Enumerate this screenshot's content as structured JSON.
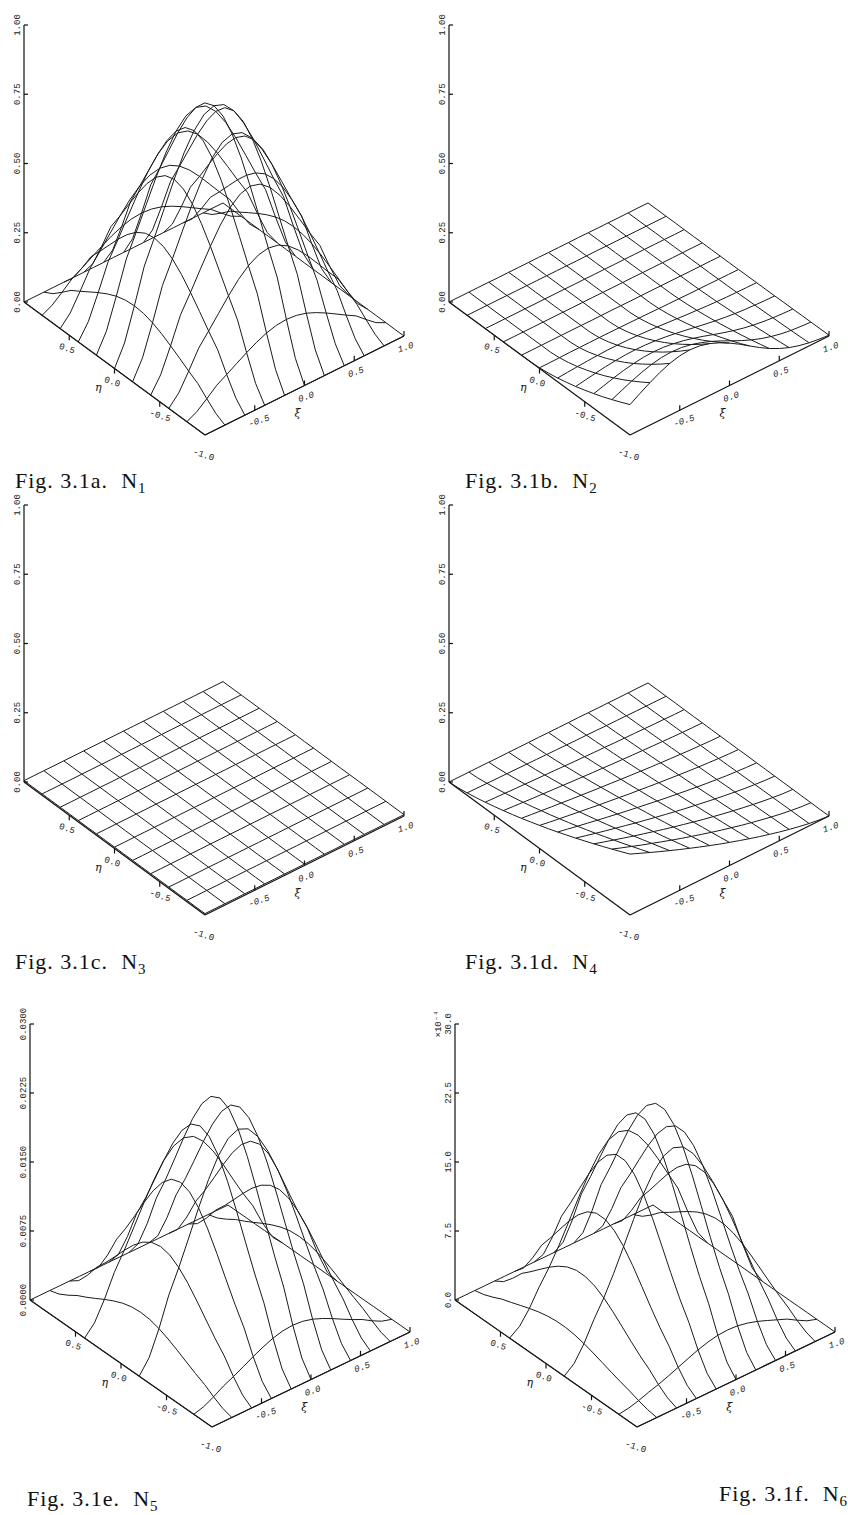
{
  "page": {
    "figures": [
      {
        "id": "a",
        "caption_prefix": "Fig. 3.1a.",
        "caption_symbol": "N",
        "caption_sub": "1"
      },
      {
        "id": "b",
        "caption_prefix": "Fig. 3.1b.",
        "caption_symbol": "N",
        "caption_sub": "2"
      },
      {
        "id": "c",
        "caption_prefix": "Fig. 3.1c.",
        "caption_symbol": "N",
        "caption_sub": "3"
      },
      {
        "id": "d",
        "caption_prefix": "Fig. 3.1d.",
        "caption_symbol": "N",
        "caption_sub": "4"
      },
      {
        "id": "e",
        "caption_prefix": "Fig. 3.1e.",
        "caption_symbol": "N",
        "caption_sub": "5"
      },
      {
        "id": "f",
        "caption_prefix": "Fig. 3.1f.",
        "caption_symbol": "N",
        "caption_sub": "6"
      }
    ]
  },
  "chart_data": [
    {
      "type": "surface3d",
      "title": "Fig. 3.1a. N1",
      "xlabel": "ξ",
      "ylabel": "η",
      "zlabel": "",
      "x_ticks": [
        "-0.5",
        "0.0",
        "0.5",
        "1.0"
      ],
      "y_ticks": [
        "0.5",
        "0.0",
        "-0.5",
        "-1.0"
      ],
      "z_ticks": [
        "0.00",
        "0.25",
        "0.50",
        "0.75",
        "1.00"
      ],
      "zlim": [
        0,
        1.0
      ],
      "z_multiplier": "",
      "grid_lines": "both",
      "surface": {
        "shape": "dome",
        "peak": 0.77,
        "peak_xi": 0.0,
        "peak_eta": 0.0,
        "width": 0.55,
        "edge_xi_minus": 0.12,
        "edge_eta_plus": 0.12
      }
    },
    {
      "type": "surface3d",
      "title": "Fig. 3.1b. N2",
      "xlabel": "ξ",
      "ylabel": "η",
      "zlabel": "",
      "x_ticks": [
        "-0.5",
        "0.0",
        "0.5",
        "1.0"
      ],
      "y_ticks": [
        "0.5",
        "0.0",
        "-0.5",
        "-1.0"
      ],
      "z_ticks": [
        "0.00",
        "0.25",
        "0.50",
        "0.75",
        "1.00"
      ],
      "zlim": [
        0,
        1.0
      ],
      "z_multiplier": "",
      "grid_lines": "both",
      "surface": {
        "shape": "edge_ridge",
        "peak": 0.2,
        "edge": "eta_minus",
        "center_xi": -0.4,
        "width": 0.6
      }
    },
    {
      "type": "surface3d",
      "title": "Fig. 3.1c. N3",
      "xlabel": "ξ",
      "ylabel": "η",
      "zlabel": "",
      "x_ticks": [
        "-0.5",
        "0.0",
        "0.5",
        "1.0"
      ],
      "y_ticks": [
        "0.5",
        "0.0",
        "-0.5",
        "-1.0"
      ],
      "z_ticks": [
        "0.00",
        "0.25",
        "0.50",
        "0.75",
        "1.00"
      ],
      "zlim": [
        0,
        1.0
      ],
      "z_multiplier": "",
      "grid_lines": "both",
      "surface": {
        "shape": "flat",
        "peak": 0.005
      }
    },
    {
      "type": "surface3d",
      "title": "Fig. 3.1d. N4",
      "xlabel": "ξ",
      "ylabel": "η",
      "zlabel": "",
      "x_ticks": [
        "-0.5",
        "0.0",
        "0.5",
        "1.0"
      ],
      "y_ticks": [
        "0.5",
        "0.0",
        "-0.5",
        "-1.0"
      ],
      "z_ticks": [
        "0.00",
        "0.25",
        "0.50",
        "0.75",
        "1.00"
      ],
      "zlim": [
        0,
        1.0
      ],
      "z_multiplier": "",
      "grid_lines": "both",
      "surface": {
        "shape": "corner",
        "peak": 0.22,
        "corner": "xi_minus_eta_minus"
      }
    },
    {
      "type": "surface3d",
      "title": "Fig. 3.1e. N5",
      "xlabel": "ξ",
      "ylabel": "η",
      "zlabel": "",
      "x_ticks": [
        "-0.5",
        "0.0",
        "0.5",
        "1.0"
      ],
      "y_ticks": [
        "0.5",
        "0.0",
        "-0.5",
        "-1.0"
      ],
      "z_ticks": [
        "0.0000",
        "0.0075",
        "0.0150",
        "0.0225",
        "0.0300"
      ],
      "zlim": [
        0,
        0.03
      ],
      "z_multiplier": "",
      "grid_lines": "sparse",
      "surface": {
        "shape": "dome",
        "peak": 0.0237,
        "peak_xi": 0.0,
        "peak_eta": 0.0,
        "width": 0.45,
        "edge_xi_minus": 0,
        "edge_eta_plus": 0
      }
    },
    {
      "type": "surface3d",
      "title": "Fig. 3.1f. N6",
      "xlabel": "ξ",
      "ylabel": "η",
      "zlabel": "",
      "x_ticks": [
        "-0.5",
        "0.0",
        "0.5",
        "1.0"
      ],
      "y_ticks": [
        "0.5",
        "0.0",
        "-0.5",
        "-1.0"
      ],
      "z_ticks": [
        "0.0",
        "7.5",
        "15.0",
        "22.5",
        "30.0"
      ],
      "zlim": [
        0,
        30.0
      ],
      "z_multiplier": "×10⁻⁴",
      "grid_lines": "sparse",
      "surface": {
        "shape": "dome",
        "peak": 22.0,
        "peak_xi": 0.1,
        "peak_eta": 0.05,
        "width": 0.45,
        "edge_xi_minus": 0,
        "edge_eta_plus": 0
      }
    }
  ]
}
